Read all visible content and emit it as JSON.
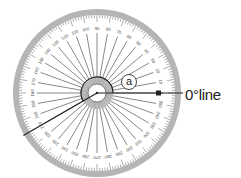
{
  "diagram": {
    "type": "full-circle protractor",
    "labels": {
      "angle_marker": "a",
      "zero_line": "0°line"
    },
    "scale": {
      "outer_numbers": [
        0,
        10,
        20,
        30,
        40,
        50,
        60,
        70,
        80,
        90,
        100,
        110,
        120,
        130,
        140,
        150,
        160,
        170,
        180,
        190,
        200,
        210,
        220,
        230,
        240,
        250,
        260,
        270,
        280,
        290,
        300,
        310,
        320,
        330,
        340,
        350
      ],
      "major_line_step_deg": 10,
      "minor_tick_step_deg": 5
    },
    "rays": {
      "zero_line_angle_deg": 0,
      "measured_ray_angle_deg": 210
    },
    "colors": {
      "rim": "#b5b5b5",
      "face": "#ffffff",
      "lines": "#555555",
      "rays": "#222222"
    }
  }
}
